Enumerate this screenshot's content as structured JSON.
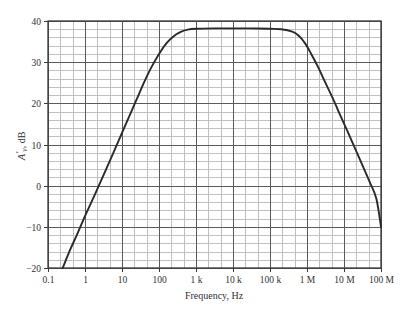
{
  "figure": {
    "background_color": "#ffffff",
    "frame_color": "#3a3a3a",
    "major_grid_color": "#5a5a5a",
    "minor_grid_color": "#b9b9b9",
    "curve_color": "#2a2a2a"
  },
  "chart_data": {
    "type": "line",
    "title": "",
    "subtitle": "",
    "xlabel": "Frequency, Hz",
    "ylabel": "A'v, dB",
    "ylabel_parts": {
      "symbol": "A",
      "prime": "′",
      "subscript": "v",
      "units": ", dB"
    },
    "x_scale": "log",
    "y_scale": "linear",
    "xlim": [
      0.1,
      100000000
    ],
    "ylim": [
      -20,
      40
    ],
    "grid": true,
    "grid_major_x": "one line per decade",
    "grid_minor_x": "3 subdivisions per decade",
    "grid_major_y": 10,
    "grid_minor_y": 2,
    "legend": "none",
    "xticks": [
      0.1,
      1,
      10,
      100,
      1000,
      10000,
      100000,
      1000000,
      10000000,
      100000000
    ],
    "xticklabels": [
      "0.1",
      "1",
      "10",
      "100",
      "1 k",
      "10 k",
      "100 k",
      "1 M",
      "10 M",
      "100 M"
    ],
    "yticks": [
      -20,
      -10,
      0,
      10,
      20,
      30,
      40
    ],
    "yticklabels": [
      "-20",
      "-10",
      "0",
      "10",
      "20",
      "30",
      "40"
    ],
    "midband_gain_db": 38,
    "low_cutoff_hz": 30,
    "high_cutoff_hz": 600000,
    "points": [
      {
        "x": 0.25,
        "y": -20.0
      },
      {
        "x": 0.4,
        "y": -15.5
      },
      {
        "x": 0.6,
        "y": -12.0
      },
      {
        "x": 1.0,
        "y": -7.4
      },
      {
        "x": 1.6,
        "y": -3.4
      },
      {
        "x": 2.5,
        "y": 0.5
      },
      {
        "x": 4.0,
        "y": 4.6
      },
      {
        "x": 6.0,
        "y": 8.2
      },
      {
        "x": 10.0,
        "y": 12.8
      },
      {
        "x": 16.0,
        "y": 17.0
      },
      {
        "x": 25.0,
        "y": 21.0
      },
      {
        "x": 40.0,
        "y": 25.2
      },
      {
        "x": 60.0,
        "y": 28.5
      },
      {
        "x": 100.0,
        "y": 32.0
      },
      {
        "x": 160.0,
        "y": 34.6
      },
      {
        "x": 250.0,
        "y": 36.3
      },
      {
        "x": 400.0,
        "y": 37.4
      },
      {
        "x": 600.0,
        "y": 37.9
      },
      {
        "x": 1000.0,
        "y": 38.1
      },
      {
        "x": 3000.0,
        "y": 38.2
      },
      {
        "x": 10000.0,
        "y": 38.2
      },
      {
        "x": 30000.0,
        "y": 38.2
      },
      {
        "x": 100000.0,
        "y": 38.1
      },
      {
        "x": 200000.0,
        "y": 38.0
      },
      {
        "x": 400000.0,
        "y": 37.4
      },
      {
        "x": 600000.0,
        "y": 36.4
      },
      {
        "x": 900000.0,
        "y": 34.5
      },
      {
        "x": 1300000.0,
        "y": 32.0
      },
      {
        "x": 2000000.0,
        "y": 28.8
      },
      {
        "x": 3000000.0,
        "y": 25.4
      },
      {
        "x": 5000000.0,
        "y": 21.2
      },
      {
        "x": 8000000.0,
        "y": 17.0
      },
      {
        "x": 13000000.0,
        "y": 12.8
      },
      {
        "x": 20000000.0,
        "y": 9.0
      },
      {
        "x": 32000000.0,
        "y": 4.8
      },
      {
        "x": 50000000.0,
        "y": 0.8
      },
      {
        "x": 75000000.0,
        "y": -3.2
      },
      {
        "x": 100000000.0,
        "y": -10.0
      }
    ]
  }
}
